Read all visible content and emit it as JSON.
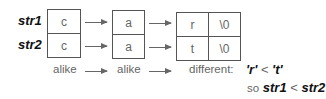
{
  "labels": {
    "str1": "str1",
    "str2": "str2"
  },
  "columns": [
    {
      "str1": "c",
      "str2": "c",
      "status": "alike"
    },
    {
      "str1": "a",
      "str2": "a",
      "status": "alike"
    },
    {
      "str1": "r",
      "str2": "t",
      "status": "different:"
    }
  ],
  "terminators": {
    "str1": "\\0",
    "str2": "\\0"
  },
  "conclusion": {
    "comparison_left": "'r'",
    "comparison_op": "<",
    "comparison_right": "'t'",
    "so_word": "so",
    "result_left": "str1",
    "result_op": "<",
    "result_right": "str2"
  }
}
